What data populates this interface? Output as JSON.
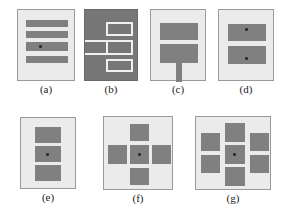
{
  "figure": {
    "title": "",
    "background_color": "#ffffff",
    "panel_fill": "#ebebeb",
    "panel_border": "#9a9a9a",
    "block_color": "#808080",
    "dark_panel_fill": "#777777",
    "line_color": "#f0f0f0",
    "dot_color": "#2e2e2e"
  },
  "panels": [
    {
      "id": "a",
      "caption": "(a)",
      "description": "four horizontal bars with centre dot on third bar",
      "inverted": false,
      "block_count": 4,
      "dot_count": 1
    },
    {
      "id": "b",
      "caption": "(b)",
      "description": "dark panel with white outline rectangles and left stem line",
      "inverted": true,
      "block_count": 3,
      "dot_count": 0
    },
    {
      "id": "c",
      "caption": "(c)",
      "description": "two stacked rectangles with downward stem",
      "inverted": false,
      "block_count": 2,
      "dot_count": 0
    },
    {
      "id": "d",
      "caption": "(d)",
      "description": "two stacked rectangles each containing a dot",
      "inverted": false,
      "block_count": 2,
      "dot_count": 2
    },
    {
      "id": "e",
      "caption": "(e)",
      "description": "three stacked rectangles with dot on middle",
      "inverted": false,
      "block_count": 3,
      "dot_count": 1
    },
    {
      "id": "f",
      "caption": "(f)",
      "description": "plus-shaped arrangement of five squares, dot in centre",
      "inverted": false,
      "block_count": 5,
      "dot_count": 1
    },
    {
      "id": "g",
      "caption": "(g)",
      "description": "seven squares in three columns, dot in centre square",
      "inverted": false,
      "block_count": 7,
      "dot_count": 1
    }
  ]
}
